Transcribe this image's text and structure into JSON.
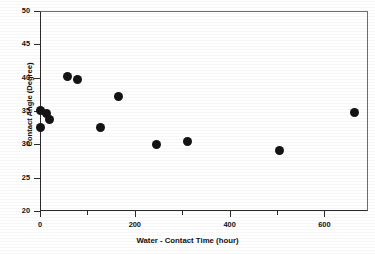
{
  "chart_data": {
    "type": "scatter",
    "title": "",
    "title_note": "title cropped off at top edge of screenshot",
    "xlabel": "Water - Contact Time (hour)",
    "ylabel": "Contact Angle (Degree)",
    "xlim": [
      0,
      692
    ],
    "ylim": [
      20,
      50
    ],
    "xticks": [
      0,
      200,
      400,
      600
    ],
    "xtick_labels": [
      "0",
      "200",
      "400",
      "600"
    ],
    "xminor_ticks": [
      100,
      300,
      500,
      700
    ],
    "yticks": [
      20,
      25,
      30,
      35,
      40,
      45,
      50
    ],
    "ytick_labels": [
      "20",
      "25",
      "30",
      "35",
      "40",
      "45",
      "50"
    ],
    "grid": false,
    "legend": false,
    "marker": "filled-circle",
    "marker_color": "#141414",
    "series": [
      {
        "name": "Contact Angle vs Water-Contact Time",
        "x": [
          0,
          2,
          13,
          21,
          57,
          80,
          128,
          166,
          246,
          312,
          505,
          663
        ],
        "y": [
          35.1,
          32.6,
          34.6,
          33.8,
          40.2,
          39.8,
          32.6,
          37.2,
          30.0,
          30.5,
          29.1,
          34.8
        ]
      }
    ]
  },
  "figure": {
    "background": "#ffffff",
    "axis_color": "#2b2b2b"
  }
}
